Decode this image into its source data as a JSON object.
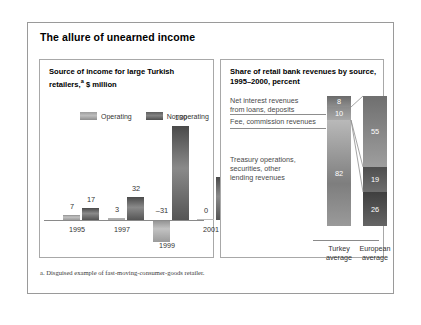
{
  "exhibit": {
    "title": "The allure of unearned income",
    "footnote": "a. Disguised example of fast-moving-consumer-goods retailer."
  },
  "left_panel": {
    "title_line1": "Source of income for large Turkish",
    "title_line2": "retailers,",
    "title_sup": "a",
    "title_line2b": " $ million",
    "legend": [
      {
        "label": "Operating",
        "swatch": "operating-swatch",
        "color": "#b0b0b0"
      },
      {
        "label": "Nonoperating",
        "swatch": "nonoperating-swatch",
        "color": "#6a6a6a"
      }
    ]
  },
  "right_panel": {
    "title_line1": "Share of retail bank revenues by source,",
    "title_line2": "1995–2000, percent",
    "labels": [
      "Net interest revenues",
      "from loans, deposits",
      "Fee, commission revenues",
      "Treasury operations,",
      "securities, other",
      "lending revenues"
    ],
    "categories": [
      {
        "line1": "Turkey",
        "line2": "average"
      },
      {
        "line1": "European",
        "line2": "average"
      }
    ]
  },
  "chart_data": [
    {
      "type": "bar",
      "title": "Source of income for large Turkish retailers, $ million",
      "xlabel": "",
      "ylabel": "$ million",
      "categories": [
        "1995",
        "1997",
        "1999",
        "2001"
      ],
      "series": [
        {
          "name": "Operating",
          "values": [
            7,
            3,
            -31,
            0
          ]
        },
        {
          "name": "Nonoperating",
          "values": [
            17,
            32,
            130,
            60
          ]
        }
      ],
      "ylim": [
        -31,
        130
      ],
      "grid": false,
      "legend": "top"
    },
    {
      "type": "bar",
      "subtype": "stacked-100",
      "title": "Share of retail bank revenues by source, 1995–2000, percent",
      "xlabel": "",
      "ylabel": "percent",
      "categories": [
        "Turkey average",
        "European average"
      ],
      "series": [
        {
          "name": "Net interest revenues from loans, deposits",
          "values": [
            8,
            55
          ]
        },
        {
          "name": "Fee, commission revenues",
          "values": [
            10,
            19
          ]
        },
        {
          "name": "Treasury operations, securities, other lending revenues",
          "values": [
            82,
            26
          ]
        }
      ],
      "ylim": [
        0,
        100
      ],
      "grid": false,
      "legend": "callout-labels"
    }
  ],
  "left_bars": [
    {
      "value": "7",
      "label": "7",
      "type": "operating",
      "left": 14,
      "height": 5,
      "valtop": 142
    },
    {
      "value": "17",
      "label": "17",
      "type": "nonoperating",
      "left": 33,
      "height": 12,
      "valtop": 135
    },
    {
      "value": "3",
      "label": "3",
      "type": "operating",
      "left": 59,
      "height": 2,
      "valtop": 145
    },
    {
      "value": "32",
      "label": "32",
      "type": "nonoperating",
      "left": 78,
      "height": 23,
      "valtop": 124
    },
    {
      "value": "–31",
      "label": "–31",
      "type": "operating",
      "left": 104,
      "height": 22,
      "valtop": 146,
      "negative": true
    },
    {
      "value": "130",
      "label": "130",
      "type": "nonoperating",
      "left": 123,
      "height": 94,
      "valtop": 53
    },
    {
      "value": "0",
      "label": "0",
      "type": "operating",
      "left": 148,
      "height": 1,
      "valtop": 146
    },
    {
      "value": "60",
      "label": "60",
      "type": "nonoperating",
      "left": 167,
      "height": 43,
      "valtop": 104
    }
  ],
  "left_xlabels": [
    {
      "text": "1995",
      "left": 4
    },
    {
      "text": "1997",
      "left": 49
    },
    {
      "text": "2001",
      "left": 138
    }
  ],
  "left_xlabel_below": {
    "text": "1999",
    "left": 94
  },
  "stacks": [
    {
      "name": "turkey",
      "segments": [
        {
          "value": "8",
          "h": 11,
          "cls": "seg-a"
        },
        {
          "value": "10",
          "h": 13,
          "cls": "seg-b"
        },
        {
          "value": "82",
          "h": 106,
          "cls": "seg-c"
        }
      ]
    },
    {
      "name": "european",
      "segments": [
        {
          "value": "55",
          "h": 71,
          "cls": "seg-d"
        },
        {
          "value": "19",
          "h": 25,
          "cls": "seg-e"
        },
        {
          "value": "26",
          "h": 34,
          "cls": "seg-f"
        }
      ]
    }
  ]
}
